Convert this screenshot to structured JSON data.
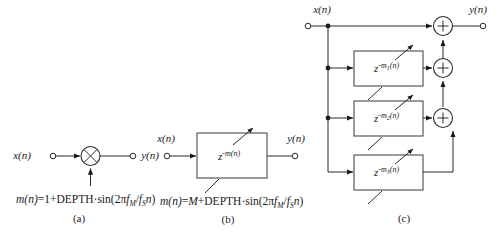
{
  "figure": {
    "watermark": "",
    "panels": [
      {
        "id": "a",
        "caption": "(a)",
        "input_label": "x(n)",
        "output_label": "y(n)",
        "operator": "multiplier",
        "operator_glyph": "×",
        "control_formula": {
          "lhs": "m(n)",
          "eq": "=",
          "rhs_const": "1",
          "plus": "+",
          "depth": "DEPTH",
          "dot": "·",
          "sin": "sin",
          "open": "(",
          "two_pi": "2π",
          "f_num": "f",
          "f_num_sub": "M",
          "slash": "/",
          "f_den": "f",
          "f_den_sub": "S",
          "n": "n",
          "close": ")",
          "full_text": "m(n)=1+DEPTH·sin(2πfM/fSn)"
        }
      },
      {
        "id": "b",
        "caption": "(b)",
        "input_label": "x(n)",
        "output_label": "y(n)",
        "block_label": {
          "base": "z",
          "exponent": "-m(n)",
          "full_text": "z^-m(n)"
        },
        "has_variable_arrow": true,
        "control_formula": {
          "lhs": "m(n)",
          "eq": "=",
          "rhs_const": "M",
          "plus": "+",
          "depth": "DEPTH",
          "dot": "·",
          "sin": "sin",
          "open": "(",
          "two_pi": "2π",
          "f_num": "f",
          "f_num_sub": "M",
          "slash": "/",
          "f_den": "f",
          "f_den_sub": "S",
          "n": "n",
          "close": ")",
          "full_text": "m(n)=M+DEPTH·sin(2πfM/fSn)"
        }
      },
      {
        "id": "c",
        "caption": "(c)",
        "input_label": "x(n)",
        "output_label": "y(n)",
        "adder_glyph": "+",
        "adder_count": 3,
        "blocks": [
          {
            "base": "z",
            "exponent_prefix": "-m",
            "exponent_sub": "1",
            "exponent_suffix": "(n)",
            "full_text": "z^-m1(n)"
          },
          {
            "base": "z",
            "exponent_prefix": "-m",
            "exponent_sub": "2",
            "exponent_suffix": "(n)",
            "full_text": "z^-m2(n)"
          },
          {
            "base": "z",
            "exponent_prefix": "-m",
            "exponent_sub": "3",
            "exponent_suffix": "(n)",
            "full_text": "z^-m3(n)"
          }
        ],
        "has_variable_arrows": true
      }
    ],
    "colors": {
      "ink": "#1a1a1a",
      "line": "#2a2a2a",
      "box_stroke": "#4a4a4a",
      "background": "#ffffff"
    }
  }
}
